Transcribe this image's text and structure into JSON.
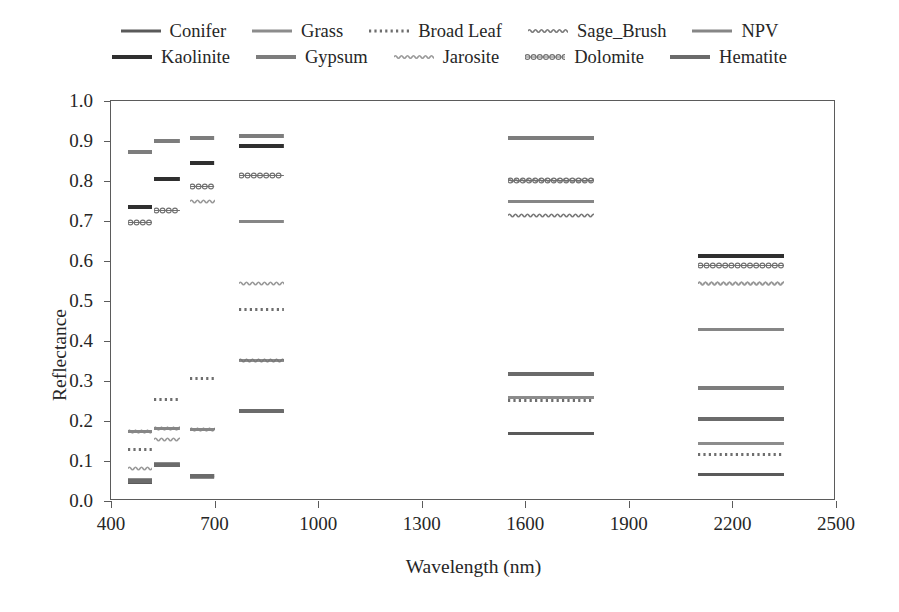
{
  "chart_data": {
    "type": "line",
    "title": "",
    "xlabel": "Wavelength (nm)",
    "ylabel": "Reflectance",
    "xlim": [
      400,
      2500
    ],
    "ylim": [
      0.0,
      1.0
    ],
    "xticks": [
      400,
      700,
      1000,
      1300,
      1600,
      1900,
      2200,
      2500
    ],
    "yticks": [
      "0.0",
      "0.1",
      "0.2",
      "0.3",
      "0.4",
      "0.5",
      "0.6",
      "0.7",
      "0.8",
      "0.9",
      "1.0"
    ],
    "grid": false,
    "legend_position": "above-plot",
    "note": "Spectral reflectance of 10 endmembers sampled over discrete sensor bands; each band drawn as a short horizontal segment.",
    "series": [
      {
        "name": "Conifer",
        "style": "solid",
        "color": "#5a5a5a",
        "weight": 3,
        "segments": [
          {
            "x0": 450,
            "x1": 520,
            "y": 0.047
          },
          {
            "x0": 525,
            "x1": 600,
            "y": 0.09
          },
          {
            "x0": 630,
            "x1": 700,
            "y": 0.063
          },
          {
            "x0": 770,
            "x1": 900,
            "y": 0.224
          },
          {
            "x0": 1550,
            "x1": 1800,
            "y": 0.17
          },
          {
            "x0": 2100,
            "x1": 2350,
            "y": 0.066
          }
        ]
      },
      {
        "name": "Grass",
        "style": "solid",
        "color": "#8c8c8c",
        "weight": 3,
        "segments": [
          {
            "x0": 450,
            "x1": 520,
            "y": 0.053
          },
          {
            "x0": 525,
            "x1": 600,
            "y": 0.093
          },
          {
            "x0": 630,
            "x1": 700,
            "y": 0.058
          },
          {
            "x0": 770,
            "x1": 900,
            "y": 0.352
          },
          {
            "x0": 1550,
            "x1": 1800,
            "y": 0.258
          },
          {
            "x0": 2100,
            "x1": 2350,
            "y": 0.143
          }
        ]
      },
      {
        "name": "Broad Leaf",
        "style": "dotted",
        "color": "#6e6e6e",
        "weight": 3,
        "segments": [
          {
            "x0": 450,
            "x1": 520,
            "y": 0.128
          },
          {
            "x0": 525,
            "x1": 600,
            "y": 0.253
          },
          {
            "x0": 630,
            "x1": 700,
            "y": 0.307
          },
          {
            "x0": 770,
            "x1": 900,
            "y": 0.478
          },
          {
            "x0": 1550,
            "x1": 1800,
            "y": 0.252
          },
          {
            "x0": 2100,
            "x1": 2350,
            "y": 0.117
          }
        ]
      },
      {
        "name": "Sage_Brush",
        "style": "wavy",
        "color": "#7a7a7a",
        "weight": 3,
        "segments": [
          {
            "x0": 450,
            "x1": 520,
            "y": 0.175
          },
          {
            "x0": 525,
            "x1": 600,
            "y": 0.182
          },
          {
            "x0": 630,
            "x1": 700,
            "y": 0.178
          },
          {
            "x0": 770,
            "x1": 900,
            "y": 0.352
          },
          {
            "x0": 1550,
            "x1": 1800,
            "y": 0.715
          },
          {
            "x0": 2100,
            "x1": 2350,
            "y": 0.545
          }
        ]
      },
      {
        "name": "NPV",
        "style": "solid",
        "color": "#868686",
        "weight": 3,
        "segments": [
          {
            "x0": 450,
            "x1": 520,
            "y": 0.174
          },
          {
            "x0": 525,
            "x1": 600,
            "y": 0.182
          },
          {
            "x0": 630,
            "x1": 700,
            "y": 0.18
          },
          {
            "x0": 770,
            "x1": 900,
            "y": 0.7
          },
          {
            "x0": 1550,
            "x1": 1800,
            "y": 0.748
          },
          {
            "x0": 2100,
            "x1": 2350,
            "y": 0.43
          }
        ]
      },
      {
        "name": "Kaolinite",
        "style": "solid",
        "color": "#2f2f2f",
        "weight": 4,
        "segments": [
          {
            "x0": 450,
            "x1": 520,
            "y": 0.735
          },
          {
            "x0": 525,
            "x1": 600,
            "y": 0.806
          },
          {
            "x0": 630,
            "x1": 700,
            "y": 0.845
          },
          {
            "x0": 770,
            "x1": 900,
            "y": 0.888
          },
          {
            "x0": 1550,
            "x1": 1800,
            "y": 0.908
          },
          {
            "x0": 2100,
            "x1": 2350,
            "y": 0.613
          }
        ]
      },
      {
        "name": "Gypsum",
        "style": "solid",
        "color": "#7d7d7d",
        "weight": 4,
        "segments": [
          {
            "x0": 450,
            "x1": 520,
            "y": 0.872
          },
          {
            "x0": 525,
            "x1": 600,
            "y": 0.899
          },
          {
            "x0": 630,
            "x1": 700,
            "y": 0.907
          },
          {
            "x0": 770,
            "x1": 900,
            "y": 0.913
          },
          {
            "x0": 1550,
            "x1": 1800,
            "y": 0.908
          },
          {
            "x0": 2100,
            "x1": 2350,
            "y": 0.283
          }
        ]
      },
      {
        "name": "Jarosite",
        "style": "wavy",
        "color": "#9a9a9a",
        "weight": 3,
        "segments": [
          {
            "x0": 450,
            "x1": 520,
            "y": 0.082
          },
          {
            "x0": 525,
            "x1": 600,
            "y": 0.155
          },
          {
            "x0": 630,
            "x1": 700,
            "y": 0.75
          },
          {
            "x0": 770,
            "x1": 900,
            "y": 0.545
          },
          {
            "x0": 1550,
            "x1": 1800,
            "y": 0.802
          },
          {
            "x0": 2100,
            "x1": 2350,
            "y": 0.545
          }
        ]
      },
      {
        "name": "Dolomite",
        "style": "bead",
        "color": "#707070",
        "weight": 3,
        "segments": [
          {
            "x0": 450,
            "x1": 520,
            "y": 0.697
          },
          {
            "x0": 525,
            "x1": 600,
            "y": 0.726
          },
          {
            "x0": 630,
            "x1": 700,
            "y": 0.786
          },
          {
            "x0": 770,
            "x1": 900,
            "y": 0.813
          },
          {
            "x0": 1550,
            "x1": 1800,
            "y": 0.802
          },
          {
            "x0": 2100,
            "x1": 2350,
            "y": 0.59
          }
        ]
      },
      {
        "name": "Hematite",
        "style": "solid",
        "color": "#6b6b6b",
        "weight": 4,
        "segments": [
          {
            "x0": 450,
            "x1": 520,
            "y": 0.049
          },
          {
            "x0": 525,
            "x1": 600,
            "y": 0.09
          },
          {
            "x0": 630,
            "x1": 700,
            "y": 0.063
          },
          {
            "x0": 770,
            "x1": 900,
            "y": 0.224
          },
          {
            "x0": 1550,
            "x1": 1800,
            "y": 0.318
          },
          {
            "x0": 2100,
            "x1": 2350,
            "y": 0.205
          }
        ]
      }
    ]
  },
  "legend": {
    "rows": [
      [
        "Conifer",
        "Grass",
        "Broad Leaf",
        "Sage_Brush",
        "NPV"
      ],
      [
        "Kaolinite",
        "Gypsum",
        "Jarosite",
        "Dolomite",
        "Hematite"
      ]
    ]
  },
  "axes": {
    "x_title": "Wavelength (nm)",
    "y_title": "Reflectance",
    "x_ticks": [
      "400",
      "700",
      "1000",
      "1300",
      "1600",
      "1900",
      "2200",
      "2500"
    ],
    "y_ticks": [
      "0.0",
      "0.1",
      "0.2",
      "0.3",
      "0.4",
      "0.5",
      "0.6",
      "0.7",
      "0.8",
      "0.9",
      "1.0"
    ]
  },
  "colors": {
    "axis": "#5b5b5b",
    "text": "#262626",
    "background": "#ffffff"
  }
}
